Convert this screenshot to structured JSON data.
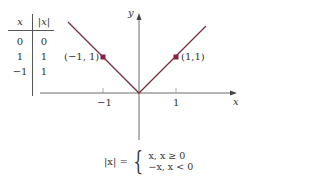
{
  "table": {
    "headers": [
      "x",
      "|x|"
    ],
    "rows": [
      [
        "0",
        "0"
      ],
      [
        "1",
        "1"
      ],
      [
        "−1",
        "1"
      ]
    ]
  },
  "graph": {
    "x_axis_label": "x",
    "y_axis_label": "y",
    "tick_labels": [
      "−1",
      "1"
    ],
    "points": [
      {
        "label": "(−1, 1)",
        "x": -1,
        "y": 1
      },
      {
        "label": "(1,1)",
        "x": 1,
        "y": 1
      }
    ],
    "line_color": "#7a2e3e",
    "point_color": "#8b2040"
  },
  "formula": {
    "lhs": "|x| =",
    "case1": "x,  x ≥ 0",
    "case2": "−x,  x < 0"
  }
}
